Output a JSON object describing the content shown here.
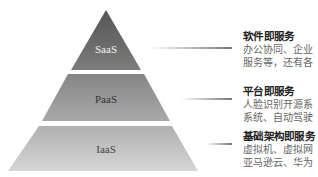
{
  "tiers": [
    {
      "label": "SaaS",
      "title": "软件即服务",
      "lines": [
        "办公协同、企业",
        "服务等，还有各"
      ],
      "fill_top": "#5a5a5a",
      "fill_bottom": "#7a7a7a",
      "text_color": "#f2f2f2"
    },
    {
      "label": "PaaS",
      "title": "平台即服务",
      "lines": [
        "人脸识别开源系",
        "系统、自动驾驶"
      ],
      "fill_top": "#8a8a8a",
      "fill_bottom": "#a8a8a8",
      "text_color": "#333333"
    },
    {
      "label": "IaaS",
      "title": "基础架构即服务",
      "lines": [
        "虚拟机、虚拟网",
        "亚马逊云、华为"
      ],
      "fill_top": "#b4b4b4",
      "fill_bottom": "#d4d4d4",
      "text_color": "#444444"
    }
  ]
}
